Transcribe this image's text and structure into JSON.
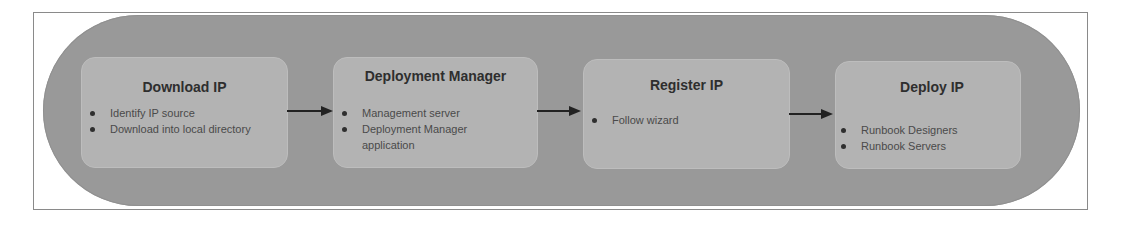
{
  "diagram": {
    "type": "process-flow",
    "colors": {
      "frame_border": "#8a8a8a",
      "pill_fill": "#999999",
      "box_fill": "#b3b3b3",
      "title_text": "#2e2e2e",
      "bullet_text": "#4a4a4a",
      "arrow": "#222222"
    },
    "steps": [
      {
        "title": "Download IP",
        "bullets": [
          "Identify IP source",
          "Download into local directory"
        ]
      },
      {
        "title": "Deployment Manager",
        "bullets": [
          "Management server",
          "Deployment Manager application"
        ]
      },
      {
        "title": "Register IP",
        "bullets": [
          "Follow wizard"
        ]
      },
      {
        "title": "Deploy IP",
        "bullets": [
          "Runbook Designers",
          "Runbook Servers"
        ]
      }
    ],
    "connectors": [
      {
        "from": "Download IP",
        "to": "Deployment Manager",
        "icon": "arrow-right-icon"
      },
      {
        "from": "Deployment Manager",
        "to": "Register IP",
        "icon": "arrow-right-icon"
      },
      {
        "from": "Register IP",
        "to": "Deploy IP",
        "icon": "arrow-right-icon"
      }
    ]
  }
}
